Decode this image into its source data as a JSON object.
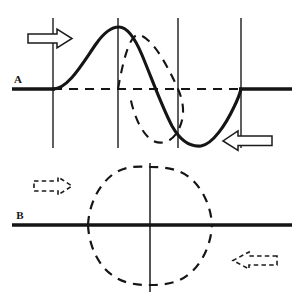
{
  "figure": {
    "background_color": "#ffffff",
    "ink_color": "#151515",
    "width": 303,
    "height": 303
  },
  "panels": [
    {
      "id": "A",
      "label": "A",
      "label_position": {
        "x": 18,
        "y": 80
      },
      "baseline": {
        "y": 89,
        "x_start": 12,
        "x_end": 292,
        "style": "solid",
        "weight": 3.2
      },
      "baseline_dashed_segment": {
        "x_start": 53,
        "x_end": 241,
        "style": "dashed"
      },
      "gridlines_x": [
        53,
        118,
        178,
        241
      ],
      "gridline_top_y": 18,
      "gridline_bottom_y": 148,
      "curves": [
        {
          "name": "incident-wave-solid",
          "style": "solid",
          "weight": 3.0,
          "description": "Full sine cycle: rises from baseline at x=53, crests at x=118, crosses zero near x=180, troughs near x=205, returns to baseline at x=241",
          "zero_crossings": [
            53,
            180,
            241
          ],
          "crest": {
            "x": 118,
            "y": 27
          },
          "trough": {
            "x": 205,
            "y": 146
          },
          "amplitude_px": 62
        },
        {
          "name": "shifted-wave-dashed",
          "style": "dashed",
          "weight": 2.0,
          "description": "Phase-shifted sine of equal amplitude: crest near x=125, crosses zero at x=178, trough near x=157 of the lagging lobe",
          "zero_crossings": [
            118,
            178
          ],
          "crest": {
            "x": 128,
            "y": 30
          },
          "trough": {
            "x": 157,
            "y": 143
          },
          "amplitude_px": 59
        }
      ],
      "arrows": [
        {
          "name": "arrow-right-solid",
          "direction": "right",
          "style": "solid-outline",
          "x": 27,
          "y": 30,
          "width": 46,
          "height": 17
        },
        {
          "name": "arrow-left-solid",
          "direction": "left",
          "style": "solid-outline",
          "x": 222,
          "y": 132,
          "width": 51,
          "height": 18
        }
      ]
    },
    {
      "id": "B",
      "label": "B",
      "label_position": {
        "x": 20,
        "y": 216
      },
      "baseline": {
        "y": 225,
        "x_start": 12,
        "x_end": 292,
        "style": "solid",
        "weight": 3.2
      },
      "axis_vertical": {
        "x": 150,
        "y_top": 163,
        "y_bottom": 292,
        "style": "solid",
        "weight": 1.6
      },
      "curves": [
        {
          "name": "envelope-upper-dashed",
          "style": "dashed",
          "weight": 2.0,
          "description": "Upper half-lobe of standing-wave envelope from x=88 to x=212 peaking at x=150",
          "zero_crossings": [
            88,
            212
          ],
          "crest": {
            "x": 150,
            "y": 167
          },
          "amplitude_px": 58
        },
        {
          "name": "envelope-lower-dashed",
          "style": "dashed",
          "weight": 2.0,
          "description": "Lower half-lobe of standing-wave envelope from x=88 to x=212 troughing at x=150",
          "zero_crossings": [
            88,
            212
          ],
          "trough": {
            "x": 150,
            "y": 285
          },
          "amplitude_px": 60
        }
      ],
      "arrows": [
        {
          "name": "arrow-right-dashed",
          "direction": "right",
          "style": "dashed-outline",
          "x": 33,
          "y": 178,
          "width": 40,
          "height": 16
        },
        {
          "name": "arrow-left-dashed",
          "direction": "left",
          "style": "dashed-outline",
          "x": 232,
          "y": 252,
          "width": 46,
          "height": 17
        }
      ]
    }
  ]
}
